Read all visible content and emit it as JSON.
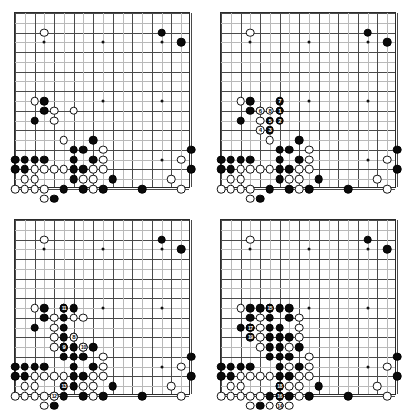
{
  "figure": {
    "layout": "2x2 grid of four 19x19 Go board diagrams",
    "board_size": 19,
    "star_points": [
      [
        3,
        3
      ],
      [
        9,
        3
      ],
      [
        15,
        3
      ],
      [
        3,
        9
      ],
      [
        9,
        9
      ],
      [
        15,
        9
      ],
      [
        3,
        15
      ],
      [
        9,
        15
      ],
      [
        15,
        15
      ]
    ],
    "colors": {
      "black_stone": "#0a0a0a",
      "white_stone": "#ffffff",
      "grid_line": "#4a4a4a",
      "grid_line_faint": "#b9b9b9",
      "board_border": "#2b2b2b",
      "board_background": "#ffffff",
      "label_on_black": "#ffffff",
      "label_on_white": "#0a0a0a"
    }
  },
  "boards": [
    {
      "name": "diagram-1",
      "caption": "",
      "black": [
        [
          15,
          2
        ],
        [
          17,
          3
        ],
        [
          3,
          9
        ],
        [
          2,
          11
        ],
        [
          3,
          10
        ],
        [
          8,
          13
        ],
        [
          6,
          14
        ],
        [
          7,
          14
        ],
        [
          8,
          15
        ],
        [
          7,
          16
        ],
        [
          0,
          15
        ],
        [
          1,
          15
        ],
        [
          2,
          15
        ],
        [
          3,
          15
        ],
        [
          0,
          16
        ],
        [
          1,
          16
        ],
        [
          6,
          15
        ],
        [
          6,
          16
        ],
        [
          6,
          17
        ],
        [
          5,
          18
        ],
        [
          7,
          18
        ],
        [
          4,
          19
        ],
        [
          10,
          17
        ],
        [
          9,
          18
        ],
        [
          13,
          18
        ],
        [
          18,
          14
        ],
        [
          18,
          16
        ]
      ],
      "white": [
        [
          3,
          2
        ],
        [
          2,
          9
        ],
        [
          4,
          10
        ],
        [
          6,
          10
        ],
        [
          4,
          11
        ],
        [
          5,
          13
        ],
        [
          9,
          14
        ],
        [
          9,
          15
        ],
        [
          8,
          16
        ],
        [
          9,
          16
        ],
        [
          2,
          16
        ],
        [
          3,
          16
        ],
        [
          4,
          16
        ],
        [
          5,
          16
        ],
        [
          7,
          17
        ],
        [
          8,
          17
        ],
        [
          1,
          17
        ],
        [
          2,
          17
        ],
        [
          0,
          18
        ],
        [
          1,
          18
        ],
        [
          2,
          18
        ],
        [
          3,
          18
        ],
        [
          8,
          18
        ],
        [
          3,
          19
        ],
        [
          17,
          15
        ],
        [
          16,
          17
        ],
        [
          17,
          18
        ]
      ],
      "labels": []
    },
    {
      "name": "diagram-2",
      "caption": "moves 1 to 8",
      "black": [
        [
          15,
          2
        ],
        [
          17,
          3
        ],
        [
          3,
          9
        ],
        [
          2,
          11
        ],
        [
          3,
          10
        ],
        [
          8,
          13
        ],
        [
          6,
          14
        ],
        [
          7,
          14
        ],
        [
          8,
          15
        ],
        [
          7,
          16
        ],
        [
          0,
          15
        ],
        [
          1,
          15
        ],
        [
          2,
          15
        ],
        [
          3,
          15
        ],
        [
          0,
          16
        ],
        [
          1,
          16
        ],
        [
          6,
          15
        ],
        [
          6,
          16
        ],
        [
          6,
          17
        ],
        [
          5,
          18
        ],
        [
          7,
          18
        ],
        [
          4,
          19
        ],
        [
          10,
          17
        ],
        [
          9,
          18
        ],
        [
          13,
          18
        ],
        [
          18,
          14
        ],
        [
          18,
          16
        ]
      ],
      "white": [
        [
          3,
          2
        ],
        [
          2,
          9
        ],
        [
          4,
          10
        ],
        [
          6,
          10
        ],
        [
          4,
          11
        ],
        [
          5,
          13
        ],
        [
          9,
          14
        ],
        [
          9,
          15
        ],
        [
          8,
          16
        ],
        [
          9,
          16
        ],
        [
          2,
          16
        ],
        [
          3,
          16
        ],
        [
          4,
          16
        ],
        [
          5,
          16
        ],
        [
          7,
          17
        ],
        [
          8,
          17
        ],
        [
          1,
          17
        ],
        [
          2,
          17
        ],
        [
          0,
          18
        ],
        [
          1,
          18
        ],
        [
          2,
          18
        ],
        [
          3,
          18
        ],
        [
          8,
          18
        ],
        [
          3,
          19
        ],
        [
          17,
          15
        ],
        [
          16,
          17
        ],
        [
          17,
          18
        ]
      ],
      "labels": [
        {
          "n": "1",
          "x": 6,
          "y": 10,
          "color": "black"
        },
        {
          "n": "2",
          "x": 6,
          "y": 11,
          "color": "black"
        },
        {
          "n": "3",
          "x": 5,
          "y": 12,
          "color": "black"
        },
        {
          "n": "4",
          "x": 4,
          "y": 12,
          "color": "white"
        },
        {
          "n": "5",
          "x": 5,
          "y": 11,
          "color": "black"
        },
        {
          "n": "6",
          "x": 4,
          "y": 10,
          "color": "white"
        },
        {
          "n": "7",
          "x": 6,
          "y": 9,
          "color": "black"
        },
        {
          "n": "8",
          "x": 5,
          "y": 10,
          "color": "white"
        }
      ]
    },
    {
      "name": "diagram-3",
      "caption": "moves 8 to 13",
      "black": [
        [
          15,
          2
        ],
        [
          17,
          3
        ],
        [
          3,
          9
        ],
        [
          2,
          11
        ],
        [
          3,
          10
        ],
        [
          5,
          9
        ],
        [
          6,
          9
        ],
        [
          5,
          10
        ],
        [
          5,
          11
        ],
        [
          5,
          12
        ],
        [
          6,
          12
        ],
        [
          8,
          13
        ],
        [
          6,
          14
        ],
        [
          7,
          14
        ],
        [
          8,
          15
        ],
        [
          7,
          16
        ],
        [
          0,
          15
        ],
        [
          1,
          15
        ],
        [
          2,
          15
        ],
        [
          3,
          15
        ],
        [
          0,
          16
        ],
        [
          1,
          16
        ],
        [
          5,
          13
        ],
        [
          6,
          13
        ],
        [
          5,
          14
        ],
        [
          6,
          15
        ],
        [
          6,
          16
        ],
        [
          6,
          17
        ],
        [
          5,
          18
        ],
        [
          7,
          18
        ],
        [
          4,
          19
        ],
        [
          10,
          17
        ],
        [
          9,
          18
        ],
        [
          13,
          18
        ],
        [
          18,
          14
        ],
        [
          18,
          16
        ]
      ],
      "white": [
        [
          3,
          2
        ],
        [
          2,
          9
        ],
        [
          4,
          10
        ],
        [
          4,
          11
        ],
        [
          4,
          12
        ],
        [
          4,
          13
        ],
        [
          6,
          10
        ],
        [
          7,
          10
        ],
        [
          5,
          13
        ],
        [
          7,
          13
        ],
        [
          9,
          14
        ],
        [
          9,
          15
        ],
        [
          8,
          16
        ],
        [
          9,
          16
        ],
        [
          2,
          16
        ],
        [
          3,
          16
        ],
        [
          4,
          16
        ],
        [
          5,
          16
        ],
        [
          7,
          17
        ],
        [
          8,
          17
        ],
        [
          1,
          17
        ],
        [
          2,
          17
        ],
        [
          0,
          18
        ],
        [
          1,
          18
        ],
        [
          2,
          18
        ],
        [
          3,
          18
        ],
        [
          8,
          18
        ],
        [
          3,
          19
        ],
        [
          4,
          18
        ],
        [
          17,
          15
        ],
        [
          16,
          17
        ],
        [
          17,
          18
        ]
      ],
      "labels": [
        {
          "n": "8",
          "x": 6,
          "y": 12,
          "color": "white"
        },
        {
          "n": "9",
          "x": 5,
          "y": 13,
          "color": "black"
        },
        {
          "n": "10",
          "x": 7,
          "y": 13,
          "color": "white"
        },
        {
          "n": "11",
          "x": 5,
          "y": 9,
          "color": "black"
        },
        {
          "n": "12",
          "x": 4,
          "y": 18,
          "color": "white"
        },
        {
          "n": "13",
          "x": 5,
          "y": 17,
          "color": "black"
        }
      ]
    },
    {
      "name": "diagram-4",
      "caption": "moves 14 to 19",
      "black": [
        [
          15,
          2
        ],
        [
          17,
          3
        ],
        [
          3,
          9
        ],
        [
          2,
          11
        ],
        [
          3,
          10
        ],
        [
          4,
          9
        ],
        [
          5,
          9
        ],
        [
          6,
          9
        ],
        [
          7,
          9
        ],
        [
          7,
          10
        ],
        [
          5,
          10
        ],
        [
          5,
          11
        ],
        [
          5,
          12
        ],
        [
          6,
          12
        ],
        [
          6,
          11
        ],
        [
          6,
          13
        ],
        [
          8,
          13
        ],
        [
          6,
          14
        ],
        [
          7,
          14
        ],
        [
          8,
          15
        ],
        [
          7,
          16
        ],
        [
          0,
          15
        ],
        [
          1,
          15
        ],
        [
          2,
          15
        ],
        [
          3,
          15
        ],
        [
          3,
          11
        ],
        [
          0,
          16
        ],
        [
          1,
          16
        ],
        [
          5,
          13
        ],
        [
          5,
          14
        ],
        [
          7,
          12
        ],
        [
          6,
          15
        ],
        [
          6,
          16
        ],
        [
          6,
          17
        ],
        [
          5,
          18
        ],
        [
          7,
          18
        ],
        [
          4,
          19
        ],
        [
          6,
          18
        ],
        [
          6,
          19
        ],
        [
          10,
          17
        ],
        [
          9,
          18
        ],
        [
          13,
          18
        ],
        [
          18,
          14
        ],
        [
          18,
          16
        ]
      ],
      "white": [
        [
          3,
          2
        ],
        [
          2,
          9
        ],
        [
          4,
          10
        ],
        [
          4,
          11
        ],
        [
          4,
          12
        ],
        [
          4,
          13
        ],
        [
          8,
          10
        ],
        [
          8,
          11
        ],
        [
          7,
          13
        ],
        [
          9,
          14
        ],
        [
          9,
          15
        ],
        [
          8,
          16
        ],
        [
          9,
          16
        ],
        [
          8,
          12
        ],
        [
          2,
          16
        ],
        [
          3,
          16
        ],
        [
          4,
          16
        ],
        [
          5,
          16
        ],
        [
          7,
          17
        ],
        [
          8,
          17
        ],
        [
          7,
          15
        ],
        [
          1,
          17
        ],
        [
          2,
          17
        ],
        [
          0,
          18
        ],
        [
          1,
          18
        ],
        [
          2,
          18
        ],
        [
          3,
          18
        ],
        [
          8,
          18
        ],
        [
          3,
          19
        ],
        [
          4,
          18
        ],
        [
          7,
          19
        ],
        [
          5,
          19
        ],
        [
          17,
          15
        ],
        [
          16,
          17
        ],
        [
          17,
          18
        ]
      ],
      "labels": [
        {
          "n": "14",
          "x": 6,
          "y": 19,
          "color": "white"
        },
        {
          "n": "15",
          "x": 5,
          "y": 9,
          "color": "black"
        },
        {
          "n": "16",
          "x": 6,
          "y": 18,
          "color": "black"
        },
        {
          "n": "17",
          "x": 3,
          "y": 11,
          "color": "black"
        },
        {
          "n": "18",
          "x": 6,
          "y": 17,
          "color": "black"
        },
        {
          "n": "19",
          "x": 3,
          "y": 12,
          "color": "black"
        }
      ]
    }
  ]
}
